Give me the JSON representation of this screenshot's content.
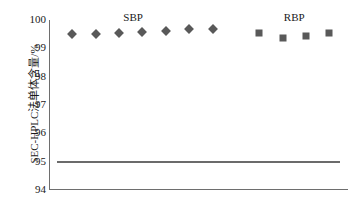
{
  "chart_data": {
    "type": "scatter",
    "title": "",
    "xlabel": "",
    "ylabel": "SEC-HPLC法单体含量/%",
    "ylim": [
      94,
      100
    ],
    "yticks": [
      100,
      99,
      98,
      97,
      96,
      95,
      94
    ],
    "ytick_labels": [
      "100",
      "99",
      "98",
      "97",
      "96",
      "95",
      "94"
    ],
    "grid": false,
    "legend_position": "inline-above-groups",
    "xaxis_visible": true,
    "xticks_visible": false,
    "series": [
      {
        "name": "SBP",
        "marker": "diamond",
        "color": "#595959",
        "x": [
          1,
          2,
          3,
          4,
          5,
          6,
          7
        ],
        "values": [
          99.5,
          99.52,
          99.55,
          99.58,
          99.6,
          99.67,
          99.7
        ]
      },
      {
        "name": "RBP",
        "marker": "square",
        "color": "#595959",
        "x": [
          9,
          10,
          11,
          12
        ],
        "values": [
          99.55,
          99.37,
          99.43,
          99.55
        ]
      }
    ],
    "annotations": [
      {
        "name": "SBP",
        "text": "SBP",
        "x": 3.6,
        "y": 100.0
      },
      {
        "name": "RBP",
        "text": "RBP",
        "x": 10.5,
        "y": 100.0
      }
    ],
    "reference_lines": [
      {
        "name": "spec-limit",
        "value": 95.0,
        "color": "#6b6b6b",
        "x_start": 0.35,
        "x_end": 12.45
      }
    ]
  }
}
